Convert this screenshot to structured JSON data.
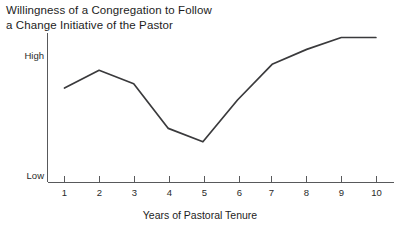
{
  "chart_data": {
    "type": "line",
    "title": "Willingness of a Congregation to Follow\na Change Initiative of the Pastor",
    "xlabel": "Years of Pastoral Tenure",
    "ylabel": "",
    "x": [
      1,
      2,
      3,
      4,
      5,
      6,
      7,
      8,
      9,
      10
    ],
    "categories": [
      "1",
      "2",
      "3",
      "4",
      "5",
      "6",
      "7",
      "8",
      "9",
      "10"
    ],
    "values": [
      0.63,
      0.75,
      0.66,
      0.36,
      0.27,
      0.55,
      0.79,
      0.89,
      0.97,
      0.97
    ],
    "series": [
      {
        "name": "Willingness to follow change initiative",
        "values": [
          0.63,
          0.75,
          0.66,
          0.36,
          0.27,
          0.55,
          0.79,
          0.89,
          0.97,
          0.97
        ]
      }
    ],
    "xlim": [
      0.6,
      10.4
    ],
    "ylim": [
      0,
      1
    ],
    "ytick_labels": [
      "High",
      "Low"
    ],
    "ytick_values": [
      1,
      0
    ],
    "grid": false,
    "legend": false,
    "line_color": "#3a3a3c",
    "axis_color": "#58595b",
    "background_color": "#ffffff"
  },
  "axes": {
    "y_high_label": "High",
    "y_low_label": "Low",
    "x_tick_labels": [
      "1",
      "2",
      "3",
      "4",
      "5",
      "6",
      "7",
      "8",
      "9",
      "10"
    ],
    "x_axis_title": "Years of Pastoral Tenure"
  }
}
